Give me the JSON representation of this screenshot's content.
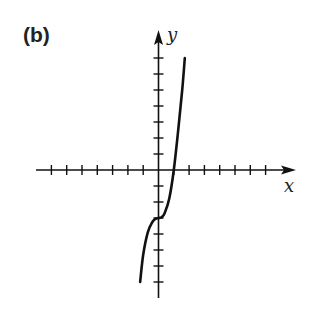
{
  "panel_label": "(b)",
  "chart_data": {
    "type": "line",
    "title": "(b)",
    "xlabel": "x",
    "ylabel": "y",
    "xlim": [
      -7,
      7
    ],
    "ylim": [
      -8,
      7
    ],
    "grid": false,
    "legend": null,
    "tick_labels": false,
    "x_ticks": [
      -7,
      -6,
      -5,
      -4,
      -3,
      -2,
      -1,
      1,
      2,
      3,
      4,
      5,
      6,
      7
    ],
    "y_ticks": [
      -7,
      -6,
      -5,
      -4,
      -3,
      -2,
      -1,
      1,
      2,
      3,
      4,
      5,
      6,
      7
    ],
    "series": [
      {
        "name": "curve",
        "description": "cubic-like curve with horizontal inflection at (0,-3), crossing x-axis at x=1",
        "x": [
          -1.2,
          -1.0,
          -0.7,
          -0.4,
          -0.2,
          0.0,
          0.2,
          0.4,
          0.7,
          1.0,
          1.3,
          1.55,
          1.72
        ],
        "y": [
          -7.0,
          -5.3,
          -3.9,
          -3.25,
          -3.05,
          -3.0,
          -2.95,
          -2.7,
          -1.8,
          0.0,
          2.6,
          5.0,
          7.0
        ]
      }
    ]
  }
}
